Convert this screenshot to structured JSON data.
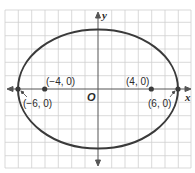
{
  "diagram": {
    "type": "ellipse-on-coordinate-grid",
    "axes": {
      "x_label": "x",
      "y_label": "y",
      "origin_label": "O"
    },
    "ellipse": {
      "center": [
        0,
        0
      ],
      "semi_major": 6,
      "semi_minor": 4.47,
      "orientation": "horizontal"
    },
    "points": [
      {
        "id": "vertex-left",
        "coords": [
          -6,
          0
        ],
        "label": "(−6, 0)"
      },
      {
        "id": "focus-left",
        "coords": [
          -4,
          0
        ],
        "label": "(−4, 0)"
      },
      {
        "id": "focus-right",
        "coords": [
          4,
          0
        ],
        "label": "(4, 0)"
      },
      {
        "id": "vertex-right",
        "coords": [
          6,
          0
        ],
        "label": "(6, 0)"
      }
    ],
    "colors": {
      "grid": "#c8c8c8",
      "curve": "#3a3a3a",
      "axis": "#555555",
      "border": "#bdbdbd"
    }
  }
}
